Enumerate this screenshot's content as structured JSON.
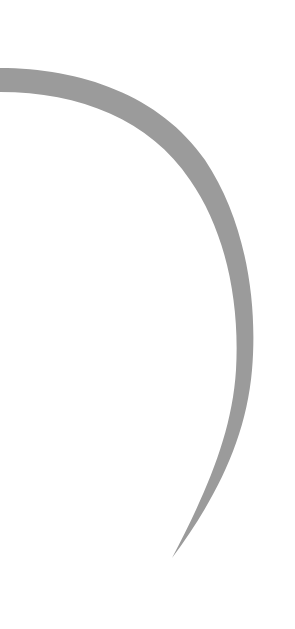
{
  "canvas": {
    "width": 295,
    "height": 629,
    "background": "#ffffff"
  },
  "shape": {
    "name": "curved-stroke",
    "fill": "#9b9b9b",
    "description": "Gray tapered crescent stroke"
  }
}
